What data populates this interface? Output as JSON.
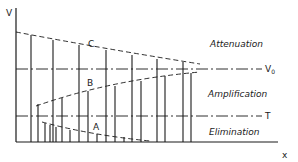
{
  "diagram": {
    "axes": {
      "y_label": "V",
      "x_label": "x"
    },
    "reference_lines": [
      {
        "label": "V₀",
        "base": "V",
        "sub": "0",
        "role": "upper-threshold"
      },
      {
        "label": "T",
        "role": "lower-threshold"
      }
    ],
    "curves": [
      {
        "label": "C",
        "description": "decaying envelope from above"
      },
      {
        "label": "B",
        "description": "rising envelope from below"
      },
      {
        "label": "A",
        "description": "decaying envelope below T"
      }
    ],
    "regions": [
      {
        "label": "Attenuation",
        "position": "above V0"
      },
      {
        "label": "Amplification",
        "position": "between T and V0"
      },
      {
        "label": "Elimination",
        "position": "below T"
      }
    ],
    "colors": {
      "ink": "#1a1a1a",
      "background": "#ffffff"
    }
  }
}
